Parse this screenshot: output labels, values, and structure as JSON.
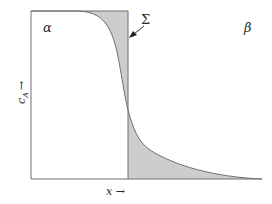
{
  "diagram": {
    "phase_left_label": "α",
    "phase_right_label": "β",
    "interface_label": "Σ",
    "x_axis_label": "x →",
    "y_axis_label": "c_A →",
    "y_axis_main": "c",
    "y_axis_sub": "A",
    "y_axis_arrow": "→",
    "colors": {
      "line": "#6f6f6f",
      "shade": "#cdcdcd",
      "text": "#2a2a2a",
      "arrow": "#1a1a1a"
    }
  }
}
